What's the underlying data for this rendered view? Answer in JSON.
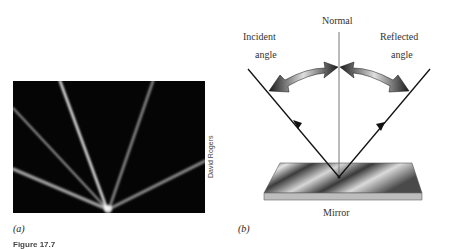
{
  "panel_a": {
    "label": "(a)",
    "photo_credit": "David Rogers",
    "description": "Photograph of laser beams reflecting off a surface at a common point",
    "colors": {
      "background": "#050505",
      "beam": "#e8e8e8"
    }
  },
  "panel_b": {
    "label": "(b)",
    "normal_label": "Normal",
    "incident_label_line1": "Incident",
    "incident_label_line2": "angle",
    "reflected_label_line1": "Reflected",
    "reflected_label_line2": "angle",
    "mirror_label": "Mirror",
    "colors": {
      "ray": "#111111",
      "normal": "#777777",
      "arrow_dark": "#1a1a1a",
      "arrow_light": "#d9d9d9",
      "mirror_dark": "#3a3a3a",
      "mirror_light": "#e0e0e0"
    }
  },
  "caption": {
    "figure_label": "Figure 17.7"
  }
}
